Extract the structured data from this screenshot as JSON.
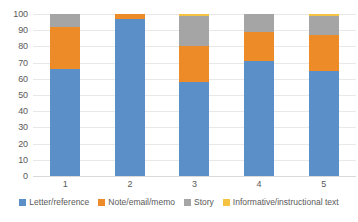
{
  "chart_data": {
    "type": "bar",
    "subtype": "stacked-100",
    "title": "",
    "xlabel": "",
    "ylabel": "",
    "categories": [
      "1",
      "2",
      "3",
      "4",
      "5"
    ],
    "ylim": [
      0,
      100
    ],
    "yticks": [
      0,
      10,
      20,
      30,
      40,
      50,
      60,
      70,
      80,
      90,
      100
    ],
    "ytick_labels": [
      "0",
      "10",
      "20",
      "30",
      "40",
      "50",
      "60",
      "70",
      "80",
      "90",
      "100"
    ],
    "grid": true,
    "legend_position": "bottom",
    "series": [
      {
        "name": "Letter/reference",
        "color": "#5B8FC7",
        "values": [
          66,
          97,
          58,
          71,
          65
        ]
      },
      {
        "name": "Note/email/memo",
        "color": "#ED8B29",
        "values": [
          26,
          3,
          22.5,
          18,
          22
        ]
      },
      {
        "name": "Story",
        "color": "#A5A5A5",
        "values": [
          8,
          0,
          18.5,
          11,
          12
        ]
      },
      {
        "name": "Informative/instructional text",
        "color": "#F5C242",
        "values": [
          0,
          0,
          1,
          0,
          1
        ]
      }
    ]
  }
}
